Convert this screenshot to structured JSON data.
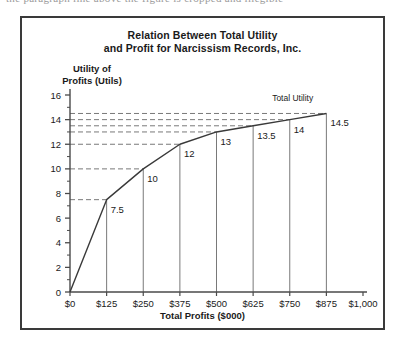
{
  "page": {
    "top_cut_text": "the paragraph line above the figure is cropped and illegible"
  },
  "figure": {
    "title_line1": "Relation Between Total Utility",
    "title_line2": "and Profit for Narcissism Records, Inc.",
    "y_axis_title_line1": "Utility of",
    "y_axis_title_line2": "Profits (Utils)",
    "x_axis_title": "Total Profits ($000)",
    "series_label": "Total Utility"
  },
  "chart_data": {
    "type": "line",
    "title": "Relation Between Total Utility and Profit for Narcissism Records, Inc.",
    "xlabel": "Total Profits ($000)",
    "ylabel": "Utility of Profits (Utils)",
    "xlim": [
      0,
      1000
    ],
    "ylim": [
      0,
      16
    ],
    "grid": false,
    "legend_position": "inline-right",
    "x_tick_labels": [
      "$0",
      "$125",
      "$250",
      "$375",
      "$500",
      "$625",
      "$750",
      "$875",
      "$1,000"
    ],
    "x_tick_values": [
      0,
      125,
      250,
      375,
      500,
      625,
      750,
      875,
      1000
    ],
    "y_tick_labels": [
      "0",
      "2",
      "4",
      "6",
      "8",
      "10",
      "12",
      "14",
      "16"
    ],
    "y_tick_values": [
      0,
      2,
      4,
      6,
      8,
      10,
      12,
      14,
      16
    ],
    "y_minor_tick_step": 1,
    "series": [
      {
        "name": "Total Utility",
        "x": [
          0,
          125,
          250,
          375,
          500,
          625,
          750,
          875
        ],
        "values": [
          0,
          7.5,
          10,
          12,
          13,
          13.5,
          14,
          14.5
        ],
        "point_labels": [
          "",
          "7.5",
          "10",
          "12",
          "13",
          "13.5",
          "14",
          "14.5"
        ],
        "color": "#3a3a3a"
      }
    ],
    "annotations": {
      "dashed_guides": "horizontal dashed lines from y-axis to each plotted point",
      "drop_lines": "vertical solid lines from each plotted point down to the x-axis"
    }
  },
  "axis_labels": {
    "y": [
      "16",
      "14",
      "12",
      "10",
      "8",
      "6",
      "4",
      "2",
      "0"
    ],
    "x": [
      "$0",
      "$125",
      "$250",
      "$375",
      "$500",
      "$625",
      "$750",
      "$875",
      "$1,000"
    ]
  },
  "point_labels": [
    "7.5",
    "10",
    "12",
    "13",
    "13.5",
    "14",
    "14.5"
  ]
}
